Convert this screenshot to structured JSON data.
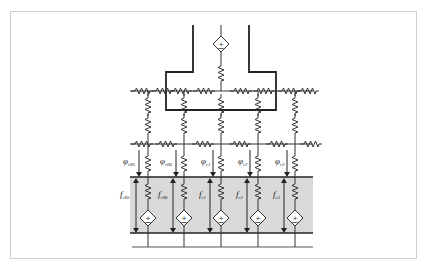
{
  "diagram": {
    "type": "equivalent-circuit",
    "top_source": {
      "symbol": "+",
      "kind": "dependent-voltage-source"
    },
    "columns": [
      {
        "id": "r05",
        "phi_label": "φ",
        "phi_sub": "r05",
        "f_label": "f",
        "f_sub": "r05"
      },
      {
        "id": "r06",
        "phi_label": "φ",
        "phi_sub": "r06",
        "f_label": "f",
        "f_sub": "r06"
      },
      {
        "id": "r1",
        "phi_label": "φ",
        "phi_sub": "r1",
        "f_label": "f",
        "f_sub": "r1"
      },
      {
        "id": "r2",
        "phi_label": "φ",
        "phi_sub": "r2",
        "f_label": "f",
        "f_sub": "r2"
      },
      {
        "id": "r3",
        "phi_label": "φ",
        "phi_sub": "r3",
        "f_label": "f",
        "f_sub": "r3"
      }
    ],
    "source_symbol": "+",
    "colors": {
      "line": "#333333",
      "shaded_region": "#d9d9d9",
      "frame": "#cfcfcf"
    }
  }
}
